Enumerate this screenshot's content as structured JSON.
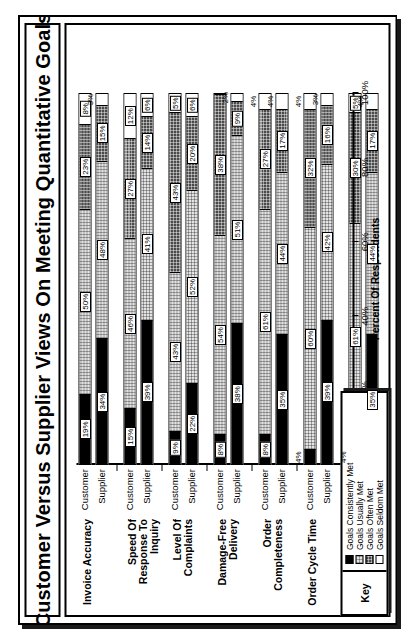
{
  "chart_data": {
    "type": "bar",
    "subtype": "stacked-horizontal-grouped",
    "title": "Customer Versus Supplier Views On Meeting Quantitative Goals",
    "xlabel": "Percent Of Respondents",
    "ylabel": "",
    "xlim": [
      0,
      100
    ],
    "xticks": [
      "0%",
      "20%",
      "40%",
      "60%",
      "80%",
      "100%"
    ],
    "xtick_values": [
      0,
      20,
      40,
      60,
      80,
      100
    ],
    "grid": false,
    "legend_position": "bottom-left",
    "legend_title": "Key",
    "series": [
      {
        "name": "Goals Consistently Met",
        "swatch": "#000000"
      },
      {
        "name": "Goals Usually Met",
        "swatch": "#e3e3e3"
      },
      {
        "name": "Goals Often Met",
        "swatch": "#4a4a4a"
      },
      {
        "name": "Goals Seldom Met",
        "swatch": "#ffffff"
      }
    ],
    "categories": [
      "Invoice Accuracy",
      "Speed Of Response To Inquiry",
      "Level Of Complaints",
      "Damage-Free Delivery",
      "Order Completeness",
      "Order Cycle Time",
      "Case/Unit Fill Rate"
    ],
    "group_series": [
      "Customer",
      "Supplier"
    ],
    "groups": [
      {
        "category": "Invoice Accuracy",
        "bars": [
          {
            "label": "Customer",
            "values": [
              19,
              50,
              23,
              8
            ],
            "labels": [
              "19%",
              "50%",
              "23%",
              "8%"
            ],
            "label_outside": [
              false,
              false,
              false,
              false
            ]
          },
          {
            "label": "Supplier",
            "values": [
              34,
              48,
              15,
              3
            ],
            "labels": [
              "34%",
              "48%",
              "15%",
              "3%"
            ],
            "label_outside": [
              false,
              false,
              false,
              true
            ]
          }
        ]
      },
      {
        "category": "Speed Of Response To Inquiry",
        "bars": [
          {
            "label": "Customer",
            "values": [
              15,
              46,
              27,
              12
            ],
            "labels": [
              "15%",
              "46%",
              "27%",
              "12%"
            ],
            "label_outside": [
              false,
              false,
              false,
              false
            ]
          },
          {
            "label": "Supplier",
            "values": [
              39,
              41,
              14,
              6
            ],
            "labels": [
              "39%",
              "41%",
              "14%",
              "6%"
            ],
            "label_outside": [
              false,
              false,
              false,
              false
            ]
          }
        ]
      },
      {
        "category": "Level Of Complaints",
        "bars": [
          {
            "label": "Customer",
            "values": [
              9,
              43,
              43,
              5
            ],
            "labels": [
              "9%",
              "43%",
              "43%",
              "5%"
            ],
            "label_outside": [
              false,
              false,
              false,
              false
            ]
          },
          {
            "label": "Supplier",
            "values": [
              22,
              52,
              20,
              6
            ],
            "labels": [
              "22%",
              "52%",
              "20%",
              "6%"
            ],
            "label_outside": [
              false,
              false,
              false,
              false
            ]
          }
        ]
      },
      {
        "category": "Damage-Free Delivery",
        "bars": [
          {
            "label": "Customer",
            "values": [
              8,
              54,
              38,
              0
            ],
            "labels": [
              "8%",
              "54%",
              "38%",
              ""
            ],
            "label_outside": [
              false,
              false,
              false,
              false
            ]
          },
          {
            "label": "Supplier",
            "values": [
              38,
              51,
              9,
              2
            ],
            "labels": [
              "38%",
              "51%",
              "9%",
              "2%"
            ],
            "label_outside": [
              false,
              false,
              false,
              true
            ]
          }
        ]
      },
      {
        "category": "Order Completeness",
        "bars": [
          {
            "label": "Customer",
            "values": [
              8,
              61,
              27,
              4
            ],
            "labels": [
              "8%",
              "61%",
              "27%",
              "4%"
            ],
            "label_outside": [
              false,
              false,
              false,
              true
            ]
          },
          {
            "label": "Supplier",
            "values": [
              35,
              44,
              17,
              4
            ],
            "labels": [
              "35%",
              "44%",
              "17%",
              "4%"
            ],
            "label_outside": [
              false,
              false,
              false,
              true
            ]
          }
        ]
      },
      {
        "category": "Order Cycle Time",
        "bars": [
          {
            "label": "Customer",
            "values": [
              4,
              60,
              32,
              4
            ],
            "labels": [
              "4%",
              "60%",
              "32%",
              "4%"
            ],
            "label_outside": [
              true,
              false,
              false,
              true
            ]
          },
          {
            "label": "Supplier",
            "values": [
              39,
              42,
              16,
              3
            ],
            "labels": [
              "39%",
              "42%",
              "16%",
              "3%"
            ],
            "label_outside": [
              false,
              false,
              false,
              true
            ]
          }
        ]
      },
      {
        "category": "Case/Unit Fill Rate",
        "bars": [
          {
            "label": "Customer",
            "values": [
              4,
              61,
              30,
              5
            ],
            "labels": [
              "4%",
              "61%",
              "30%",
              "5%"
            ],
            "label_outside": [
              true,
              false,
              false,
              false
            ]
          },
          {
            "label": "Supplier",
            "values": [
              35,
              44,
              17,
              4
            ],
            "labels": [
              "35%",
              "44%",
              "17%",
              "4%"
            ],
            "label_outside": [
              false,
              false,
              false,
              true
            ]
          }
        ]
      }
    ]
  }
}
